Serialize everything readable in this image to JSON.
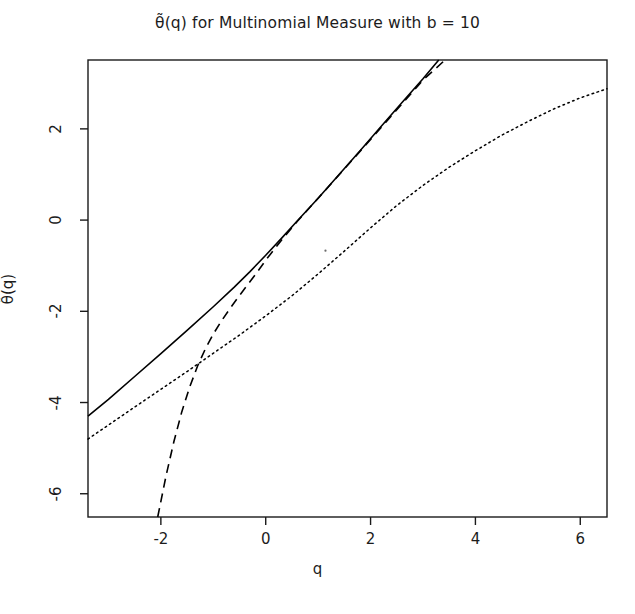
{
  "chart_data": {
    "type": "line",
    "title": "θ̃(q) for Multinomial Measure with b = 10",
    "xlabel": "q",
    "ylabel": "θ̃(q)",
    "xlim": [
      -3.39,
      6.51
    ],
    "ylim": [
      -6.51,
      3.51
    ],
    "xticks": [
      -2,
      0,
      2,
      4,
      6
    ],
    "xtick_labels": [
      "-2",
      "0",
      "2",
      "4",
      "6"
    ],
    "yticks": [
      2,
      0,
      -2,
      -4,
      -6
    ],
    "ytick_labels": [
      "2",
      "0",
      "-2",
      "-4",
      "-6"
    ],
    "grid": false,
    "legend": null,
    "box": true,
    "series": [
      {
        "name": "solid",
        "style": "solid",
        "color": "#000000",
        "width": 1.6,
        "points": [
          [
            -3.39,
            -4.3
          ],
          [
            -3.0,
            -3.93
          ],
          [
            -2.5,
            -3.43
          ],
          [
            -2.0,
            -2.93
          ],
          [
            -1.5,
            -2.42
          ],
          [
            -1.0,
            -1.9
          ],
          [
            -0.6,
            -1.47
          ],
          [
            -0.3,
            -1.13
          ],
          [
            0.0,
            -0.77
          ],
          [
            0.3,
            -0.4
          ],
          [
            0.6,
            -0.02
          ],
          [
            1.0,
            0.48
          ],
          [
            1.4,
            1.0
          ],
          [
            1.8,
            1.52
          ],
          [
            2.2,
            2.05
          ],
          [
            2.6,
            2.58
          ],
          [
            3.0,
            3.1
          ],
          [
            3.3,
            3.51
          ]
        ]
      },
      {
        "name": "dashed",
        "style": "dashed",
        "color": "#000000",
        "width": 1.6,
        "points": [
          [
            -2.06,
            -6.51
          ],
          [
            -1.9,
            -5.6
          ],
          [
            -1.75,
            -4.85
          ],
          [
            -1.6,
            -4.2
          ],
          [
            -1.45,
            -3.66
          ],
          [
            -1.3,
            -3.2
          ],
          [
            -1.15,
            -2.82
          ],
          [
            -1.0,
            -2.5
          ],
          [
            -0.85,
            -2.22
          ],
          [
            -0.7,
            -1.97
          ],
          [
            -0.55,
            -1.73
          ],
          [
            -0.4,
            -1.5
          ],
          [
            -0.2,
            -1.2
          ],
          [
            0.0,
            -0.88
          ],
          [
            0.3,
            -0.44
          ],
          [
            0.6,
            -0.03
          ],
          [
            1.0,
            0.48
          ],
          [
            1.5,
            1.12
          ],
          [
            2.0,
            1.77
          ],
          [
            2.5,
            2.42
          ],
          [
            3.0,
            3.07
          ],
          [
            3.42,
            3.51
          ]
        ]
      },
      {
        "name": "dotted",
        "style": "dotted",
        "color": "#000000",
        "width": 1.5,
        "points": [
          [
            -3.39,
            -4.8
          ],
          [
            -2.5,
            -4.1
          ],
          [
            -1.5,
            -3.32
          ],
          [
            -0.5,
            -2.52
          ],
          [
            0.0,
            -2.1
          ],
          [
            0.5,
            -1.66
          ],
          [
            1.0,
            -1.18
          ],
          [
            1.5,
            -0.68
          ],
          [
            2.0,
            -0.17
          ],
          [
            2.5,
            0.32
          ],
          [
            3.0,
            0.76
          ],
          [
            3.5,
            1.16
          ],
          [
            4.0,
            1.52
          ],
          [
            4.5,
            1.86
          ],
          [
            5.0,
            2.16
          ],
          [
            5.5,
            2.44
          ],
          [
            6.0,
            2.68
          ],
          [
            6.51,
            2.88
          ]
        ]
      }
    ],
    "stray_mark": {
      "x": 1.14,
      "y": -0.67
    }
  }
}
